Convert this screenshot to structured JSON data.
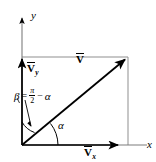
{
  "figure": {
    "background_color": "#ffffff",
    "stroke_color": "#000000",
    "guide_color": "#8a8a8a",
    "width": 156,
    "height": 162
  },
  "axes": {
    "x_label": "x",
    "y_label": "y",
    "origin": {
      "x": 22,
      "y": 145
    },
    "x_axis_end": {
      "x": 145,
      "y": 145
    },
    "y_axis_end": {
      "x": 22,
      "y": 15
    }
  },
  "vectors": [
    {
      "id": "resultant",
      "symbol": "V",
      "subscript": "",
      "label": "V",
      "from": {
        "x": 22,
        "y": 145
      },
      "to": {
        "x": 128,
        "y": 57
      },
      "label_pos": {
        "x": 76,
        "y": 54
      }
    },
    {
      "id": "y-component",
      "symbol": "V",
      "subscript": "y",
      "label": "Vy",
      "from": {
        "x": 22,
        "y": 145
      },
      "to": {
        "x": 22,
        "y": 57
      },
      "label_pos": {
        "x": 27,
        "y": 63
      }
    },
    {
      "id": "x-component",
      "symbol": "V",
      "subscript": "x",
      "label": "Vx",
      "from": {
        "x": 22,
        "y": 145
      },
      "to": {
        "x": 121,
        "y": 145
      },
      "label_pos": {
        "x": 84,
        "y": 147
      }
    }
  ],
  "angles": {
    "alpha": {
      "symbol": "α",
      "label_pos": {
        "x": 58,
        "y": 127
      },
      "description": "angle between x-axis and resultant vector"
    },
    "beta": {
      "symbol": "β",
      "equals": "=",
      "minus": "−",
      "numerator": "π",
      "denominator": "2",
      "alpha": "α",
      "full_text": "β = π/2 − α",
      "label_pos": {
        "x": 14,
        "y": 89
      },
      "description": "complementary angle between resultant and y-direction"
    }
  },
  "rectangle": {
    "left": 22,
    "top": 57,
    "right": 128,
    "bottom": 145,
    "description": "construction rectangle of the components"
  }
}
